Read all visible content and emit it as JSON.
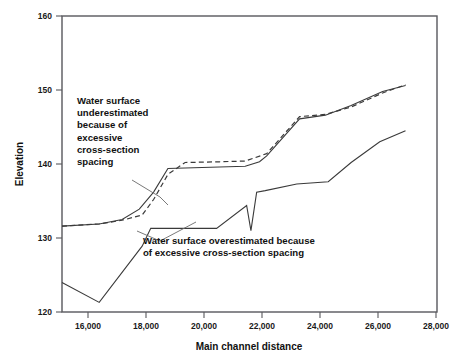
{
  "chart_data": {
    "type": "line",
    "title": "",
    "xlabel": "Main channel distance",
    "ylabel": "Elevation",
    "xlim": [
      14900,
      28000
    ],
    "ylim": [
      120,
      160
    ],
    "xticks": [
      "16,000",
      "18,000",
      "20,000",
      "22,000",
      "24,000",
      "26,000",
      "28,000"
    ],
    "xtick_values": [
      16000,
      18000,
      20000,
      22000,
      24000,
      26000,
      28000
    ],
    "yticks": [
      "120",
      "130",
      "140",
      "150",
      "160"
    ],
    "ytick_values": [
      120,
      130,
      140,
      150,
      160
    ],
    "grid": false,
    "legend": "none",
    "series": [
      {
        "name": "Water surface (fine cross-section spacing)",
        "style": "solid",
        "x": [
          14900,
          16200,
          17000,
          17600,
          18100,
          18600,
          19500,
          20400,
          21300,
          21800,
          22050,
          23200,
          24100,
          25000,
          26100,
          26900
        ],
        "y": [
          131.6,
          131.9,
          132.5,
          133.9,
          136.2,
          139.4,
          139.5,
          139.6,
          139.7,
          140.3,
          141.1,
          146.1,
          146.6,
          147.9,
          149.8,
          150.6
        ]
      },
      {
        "name": "Water surface (excessive cross-section spacing)",
        "style": "dashed",
        "x": [
          14900,
          16200,
          17000,
          17700,
          18100,
          18600,
          19200,
          20400,
          21300,
          22050,
          23200,
          24100,
          25000,
          26100,
          26900
        ],
        "y": [
          131.6,
          131.9,
          132.4,
          133.1,
          135.2,
          138.6,
          140.2,
          140.3,
          140.4,
          141.4,
          146.4,
          146.7,
          147.7,
          149.6,
          150.7
        ]
      },
      {
        "name": "Channel bottom",
        "style": "solid",
        "x": [
          14900,
          16200,
          17700,
          18000,
          20300,
          21350,
          21500,
          21700,
          22000,
          23100,
          24200,
          25000,
          26000,
          26900
        ],
        "y": [
          124.0,
          121.3,
          128.9,
          131.3,
          131.3,
          134.4,
          131.0,
          136.2,
          136.4,
          137.3,
          137.6,
          140.2,
          143.0,
          144.5
        ]
      }
    ],
    "annotations": [
      {
        "id": "underestimated-note",
        "lines": [
          "Water surface",
          "underestimated",
          "because of",
          "excessive",
          "cross-section",
          "spacing"
        ],
        "x": 77,
        "y": 104
      },
      {
        "id": "overestimated-note",
        "lines": [
          "Water surface overestimated because",
          "of excessive cross-section spacing"
        ],
        "x": 143,
        "y": 244
      }
    ]
  }
}
